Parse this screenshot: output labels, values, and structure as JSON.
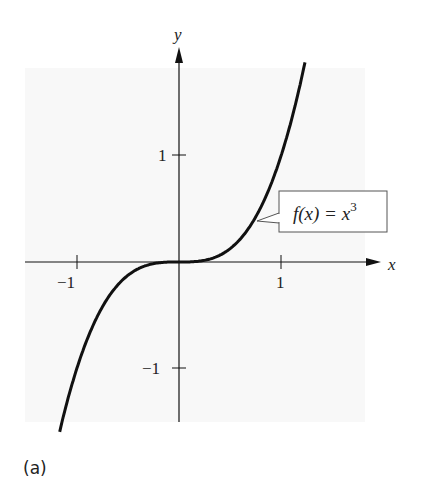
{
  "chart_data": {
    "type": "line",
    "title": "",
    "function_label": "f(x) = x^3",
    "label_parts": {
      "lhs": "f(x) = x",
      "exp": "3"
    },
    "xlabel": "x",
    "ylabel": "y",
    "xticks": [
      {
        "value": -1,
        "label": "−1"
      },
      {
        "value": 1,
        "label": "1"
      }
    ],
    "yticks": [
      {
        "value": 1,
        "label": "1"
      },
      {
        "value": -1,
        "label": "−1"
      }
    ],
    "xlim": [
      -1.5,
      1.8
    ],
    "ylim": [
      -1.5,
      2.0
    ],
    "series": [
      {
        "name": "f(x) = x^3",
        "x": [
          -1.17,
          -1.0,
          -0.8,
          -0.6,
          -0.4,
          -0.2,
          0,
          0.2,
          0.4,
          0.6,
          0.8,
          1.0,
          1.2,
          1.235
        ],
        "y": [
          -1.6,
          -1.0,
          -0.512,
          -0.216,
          -0.064,
          -0.008,
          0,
          0.008,
          0.064,
          0.216,
          0.512,
          1.0,
          1.728,
          1.884
        ]
      }
    ],
    "grid": false,
    "legend": "none"
  },
  "caption": "(a)"
}
